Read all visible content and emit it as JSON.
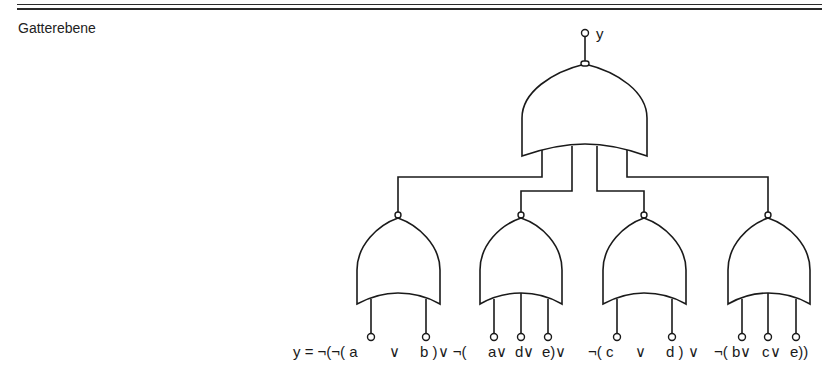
{
  "header": {
    "title": "Gatterebene"
  },
  "diagram": {
    "output_label": "y",
    "top_gate": {
      "type": "NAND-style (negated output)",
      "inputs": 4
    },
    "gates": [
      {
        "id": "g1",
        "inputs": [
          "a",
          "b"
        ]
      },
      {
        "id": "g2",
        "inputs": [
          "a",
          "d",
          "e"
        ]
      },
      {
        "id": "g3",
        "inputs": [
          "c",
          "d"
        ]
      },
      {
        "id": "g4",
        "inputs": [
          "b",
          "c",
          "e"
        ]
      }
    ],
    "formula": {
      "parts": [
        "y = ¬(¬( a",
        "∨",
        "b )∨ ¬(",
        "a∨",
        "d∨",
        "e)∨",
        "¬( c",
        "∨",
        "d ) ∨",
        "¬( b∨",
        "c∨",
        "e))"
      ],
      "full": "y = ¬(¬( a ∨ b )∨ ¬( a∨ d∨ e)∨ ¬( c ∨ d ) ∨ ¬( b∨ c∨ e))"
    }
  }
}
